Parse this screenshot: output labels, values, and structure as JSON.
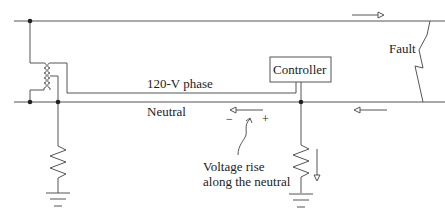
{
  "diagram": {
    "labels": {
      "phase": "120-V phase",
      "neutral": "Neutral",
      "controller": "Controller",
      "fault": "Fault",
      "voltage_rise_line1": "Voltage rise",
      "voltage_rise_line2": "along the neutral",
      "minus": "−",
      "plus": "+"
    },
    "components": [
      "primary-line",
      "neutral-line",
      "transformer",
      "controller-box",
      "ground-resistor-source",
      "ground-resistor-load",
      "fault-arc",
      "current-arrow-top",
      "current-arrow-neutral-right",
      "voltage-rise-arrow",
      "ground-current-arrow"
    ],
    "colors": {
      "line": "#555555",
      "text": "#222222"
    }
  }
}
